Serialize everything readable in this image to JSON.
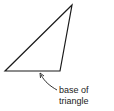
{
  "diagram": {
    "shape": "triangle",
    "vertices": [
      [
        72,
        5
      ],
      [
        5,
        71
      ],
      [
        60,
        71
      ]
    ],
    "stroke_color": "#1a1a1a",
    "annotation": {
      "line1": "base of",
      "line2": "triangle"
    }
  }
}
